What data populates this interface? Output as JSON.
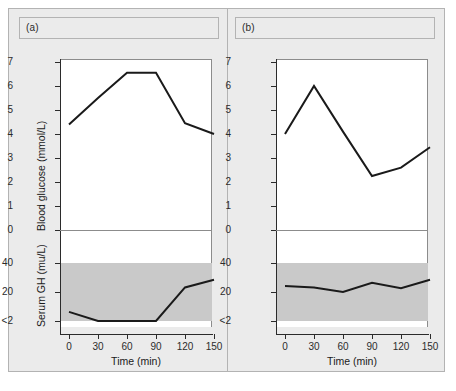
{
  "figure": {
    "panels": [
      {
        "id": "a",
        "label": "(a)",
        "glucose_axis_title": "Blood glucose (mmol/L)",
        "gh_axis_title": "Serum GH (mu/L)",
        "x_axis_title": "Time (min)"
      },
      {
        "id": "b",
        "label": "(b)",
        "glucose_axis_title": "Blood glucose (mmol/L)",
        "gh_axis_title": "Serum GH (mu/L)",
        "x_axis_title": "Time (min)"
      }
    ],
    "glucose_yticks": [
      "0",
      "1",
      "2",
      "3",
      "4",
      "5",
      "6",
      "7"
    ],
    "gh_yticks": [
      "<2",
      "20",
      "40"
    ],
    "xticks": [
      "0",
      "30",
      "60",
      "90",
      "120",
      "150"
    ],
    "colors": {
      "line": "#1a1a1a",
      "band": "#c9c9c9",
      "panel_background": "#ebebeb",
      "plot_background": "#ffffff",
      "frame": "#b3b3b3",
      "axis": "#2b2b2b"
    }
  },
  "chart_data": [
    {
      "type": "line",
      "panel": "a",
      "subplot": "upper",
      "title": "(a) Blood glucose",
      "xlabel": "Time (min)",
      "ylabel": "Blood glucose (mmol/L)",
      "x": [
        0,
        30,
        60,
        90,
        120,
        150
      ],
      "values": [
        4.4,
        5.5,
        6.55,
        6.55,
        4.45,
        4.0
      ],
      "xlim": [
        -10,
        160
      ],
      "ylim": [
        0,
        7.4
      ],
      "xticks": [
        0,
        30,
        60,
        90,
        120,
        150
      ],
      "yticks": [
        0,
        1,
        2,
        3,
        4,
        5,
        6,
        7
      ],
      "grid": false,
      "legend": "none"
    },
    {
      "type": "line",
      "panel": "a",
      "subplot": "lower",
      "title": "(a) Serum GH",
      "xlabel": "Time (min)",
      "ylabel": "Serum GH (mu/L)",
      "x": [
        0,
        30,
        60,
        90,
        120,
        150
      ],
      "values": [
        8,
        2,
        2,
        2,
        24,
        29
      ],
      "xlim": [
        -10,
        160
      ],
      "ylim": [
        2,
        40
      ],
      "xticks": [
        0,
        30,
        60,
        90,
        120,
        150
      ],
      "yticks": [
        "<2",
        20,
        40
      ],
      "shaded_band": {
        "from": "<2",
        "to": 40,
        "color": "#c9c9c9"
      },
      "grid": false,
      "legend": "none",
      "annotation": "GH suppressed to <2 mu/L between 30 and 90 min"
    },
    {
      "type": "line",
      "panel": "b",
      "subplot": "upper",
      "title": "(b) Blood glucose",
      "xlabel": "Time (min)",
      "ylabel": "Blood glucose (mmol/L)",
      "x": [
        0,
        30,
        60,
        90,
        120,
        150
      ],
      "values": [
        4.0,
        6.0,
        4.1,
        2.25,
        2.6,
        3.45
      ],
      "xlim": [
        -10,
        160
      ],
      "ylim": [
        0,
        7.4
      ],
      "xticks": [
        0,
        30,
        60,
        90,
        120,
        150
      ],
      "yticks": [
        0,
        1,
        2,
        3,
        4,
        5,
        6,
        7
      ],
      "grid": false,
      "legend": "none"
    },
    {
      "type": "line",
      "panel": "b",
      "subplot": "lower",
      "title": "(b) Serum GH",
      "xlabel": "Time (min)",
      "ylabel": "Serum GH (mu/L)",
      "x": [
        0,
        30,
        60,
        90,
        120,
        150
      ],
      "values": [
        25,
        24,
        21,
        27,
        23.5,
        29
      ],
      "xlim": [
        -10,
        160
      ],
      "ylim": [
        2,
        40
      ],
      "xticks": [
        0,
        30,
        60,
        90,
        120,
        150
      ],
      "yticks": [
        "<2",
        20,
        40
      ],
      "shaded_band": {
        "from": "<2",
        "to": 40,
        "color": "#c9c9c9"
      },
      "grid": false,
      "legend": "none",
      "annotation": "GH fails to suppress, remains elevated throughout"
    }
  ]
}
